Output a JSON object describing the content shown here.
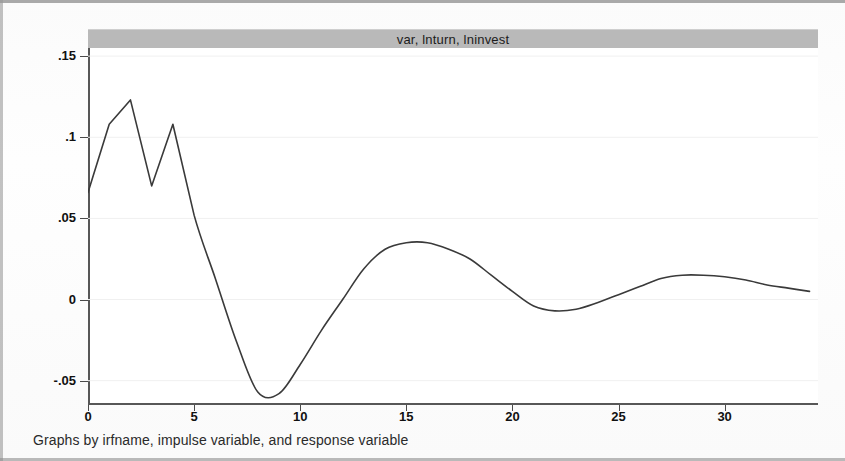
{
  "figure": {
    "width": 845,
    "height": 461,
    "caption": "Graphs by irfname, impulse variable, and response variable",
    "background_color": "#ffffff",
    "title_strip_color": "#b9b9b9",
    "line_color": "#3a3a3a",
    "axis_color": "#575757",
    "grid_color": "#f0f0f0"
  },
  "chart_data": {
    "type": "line",
    "title": "var, lnturn, lninvest",
    "subtitle": "",
    "xlabel": "",
    "ylabel": "",
    "xlim": [
      0,
      34.4
    ],
    "ylim": [
      -0.065,
      0.155
    ],
    "grid": true,
    "grid_axis": "y",
    "legend": null,
    "legend_position": "none",
    "xticks": [
      0,
      5,
      10,
      15,
      20,
      25,
      30
    ],
    "xtick_labels": [
      "0",
      "5",
      "10",
      "15",
      "20",
      "25",
      "30"
    ],
    "yticks": [
      0.15,
      0.1,
      0.05,
      0,
      -0.05
    ],
    "ytick_labels": [
      ".15",
      ".1",
      ".05",
      "0",
      "-.05"
    ],
    "series": [
      {
        "name": "orthogonalized irf",
        "x": [
          0,
          1,
          2,
          3,
          4,
          5,
          6,
          7,
          8,
          9,
          10,
          11,
          12,
          13,
          14,
          15,
          16,
          17,
          18,
          19,
          20,
          21,
          22,
          23,
          24,
          25,
          26,
          27,
          28,
          29,
          30,
          31,
          32,
          33,
          34
        ],
        "values": [
          0.066,
          0.108,
          0.123,
          0.07,
          0.108,
          0.052,
          0.013,
          -0.026,
          -0.057,
          -0.058,
          -0.04,
          -0.019,
          0.0,
          0.019,
          0.031,
          0.035,
          0.035,
          0.031,
          0.025,
          0.015,
          0.005,
          -0.004,
          -0.007,
          -0.006,
          -0.002,
          0.003,
          0.008,
          0.013,
          0.015,
          0.015,
          0.014,
          0.012,
          0.009,
          0.007,
          0.005
        ]
      }
    ],
    "annotations": []
  }
}
